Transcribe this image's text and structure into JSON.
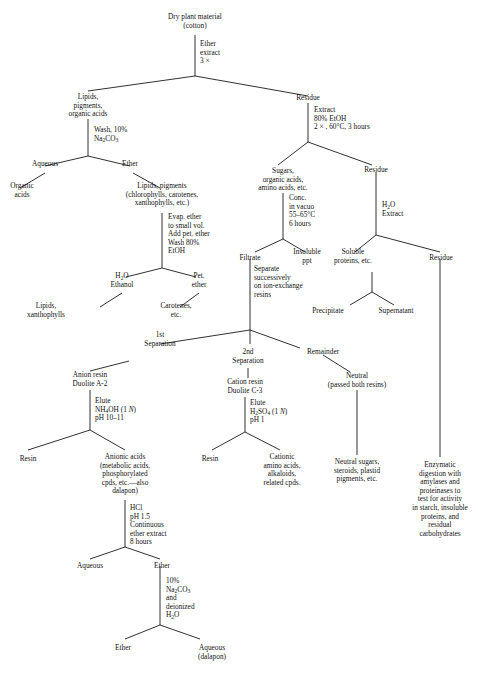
{
  "diagram": {
    "background_color": "#ffffff",
    "line_color": "#1a1a1a",
    "text_color": "#111111"
  },
  "nodes": {
    "root": "Dry plant material\n(cotton)",
    "ether_extract_3x": "Ether\nextract\n3 ×",
    "lipids_pigments_organic_acids": "Lipids,\npigments,\norganic acids",
    "residue_top": "Residue",
    "wash_na2co3": "Wash, 10%\nNa₂CO₃",
    "extract_80_etoh": "Extract\n80% EtOH\n2 × , 60°C, 3 hours",
    "aqueous_1": "Aqueous",
    "ether_1": "Ether",
    "organic_acids": "Organic\nacids",
    "lipids_pigments_detail": "Lipids, pigments\n(chlorophylls, carotenes,\nxanthophylls, etc.)",
    "sugars_organic_amino": "Sugars,\norganic acids,\namino acids, etc.",
    "residue_2": "Residue",
    "evap_ether": "Evap. ether\nto small vol.\nAdd pet. ether\nWash 80%\nEtOH",
    "conc_in_vacuo": "Conc.\nin vacuo\n55–65°C\n6 hours",
    "h2o_extract": "H₂O\nExtract",
    "h2o_ethanol": "H₂O\nEthanol",
    "pet_ether": "Pet.\nether",
    "filtrate": "Filtrate",
    "insoluble_ppt": "Insoluble\nppt",
    "soluble_proteins": "Soluble\nproteins, etc.",
    "residue_3": "Residue",
    "lipids_xanthophylls": "Lipids,\nxanthophylls",
    "carotenes_etc": "Carotenes,\netc.",
    "separate_successively": "Separate\nsuccessively\non ion-exchange\nresins",
    "precipitate": "Precipitate",
    "supernatant": "Supernatant",
    "first_separation": "1st\nSeparation",
    "second_separation": "2nd\nSeparation",
    "remainder": "Remainder",
    "neutral_passed": "Neutral\n(passed both resins)",
    "anion_resin": "Anion resin\nDuolite A-2",
    "cation_resin": "Cation resin\nDuolite C-3",
    "elute_nh4oh": "Elute\nNH₄OH (1 N)\npH 10–11",
    "elute_h2so4": "Elute\nH₂SO₄ (1 N)\npH 1",
    "resin_left": "Resin",
    "resin_mid": "Resin",
    "anionic_acids": "Anionic acids\n(metabolic acids,\nphosphorylated\ncpds, etc.—also\ndalapon)",
    "cationic_amino_acids": "Cationic\namino acids,\nalkaloids,\nrelated cpds.",
    "neutral_sugars": "Neutral sugars,\nsteroids, plastid\npigments, etc.",
    "enzymatic_digestion": "Enzymatic\ndigestion with\namylases and\nproteinases to\ntest for activity\nin starch, insoluble\nproteins, and\nresidual\ncarbohydrates",
    "hcl_step": "HCl\npH 1.5\nContinuous\nether extract\n8 hours",
    "aqueous_2": "Aqueous",
    "ether_2": "Ether",
    "na2co3_deionized": "10%\nNa₂CO₃\nand\ndeionized\nH₂O",
    "ether_3": "Ether",
    "aqueous_dalapon": "Aqueous\n(dalapon)"
  }
}
